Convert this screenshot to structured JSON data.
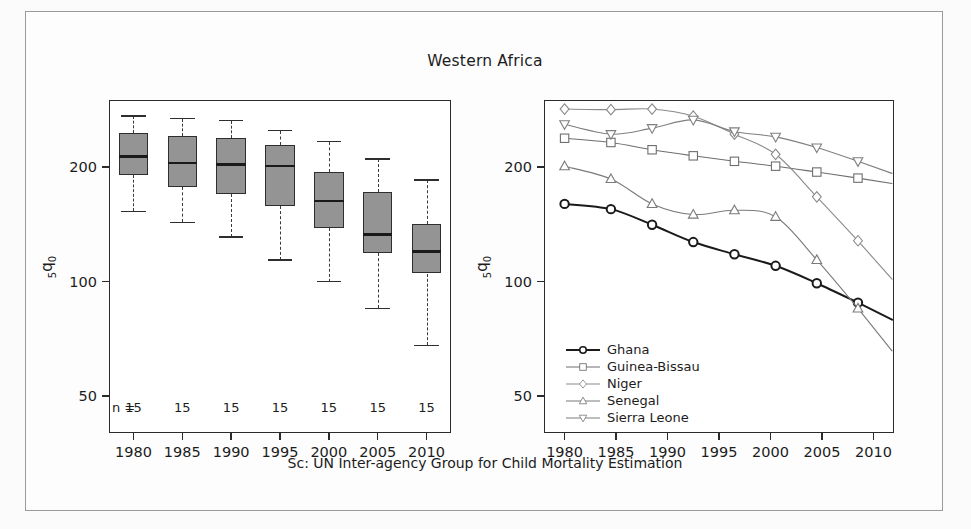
{
  "figure": {
    "title": "Western Africa",
    "caption": "Sc: UN Inter-agency Group for Child Mortality Estimation",
    "ylabel": "5q0",
    "ylabel_parts": {
      "sub_left": "5",
      "main": "q",
      "sub_right": "0"
    },
    "n_prefix": "n ="
  },
  "colors": {
    "box_fill": "#949494",
    "box_edge": "#2e2e2e",
    "median": "#1a1a1a",
    "frame": "#2b2b2b",
    "text": "#1c1c1c",
    "ghana": "#1a1a1a",
    "guinea_bissau": "#6e6e6e",
    "niger": "#8a8a8a",
    "senegal": "#7a7a7a",
    "sierra_leone": "#7f7f7f",
    "paper": "#fdfdfd"
  },
  "chart_data": [
    {
      "type": "box",
      "panel": "left",
      "title": "Western Africa",
      "xlabel": "",
      "ylabel": "5q0",
      "yscale": "log",
      "ylim": [
        40,
        300
      ],
      "yticks": [
        50,
        100,
        200
      ],
      "ytick_labels": [
        "50",
        "100",
        "200"
      ],
      "categories": [
        1980,
        1985,
        1990,
        1995,
        2000,
        2005,
        2010
      ],
      "xtick_labels": [
        "1980",
        "1985",
        "1990",
        "1995",
        "2000",
        "2005",
        "2010"
      ],
      "counts": [
        15,
        15,
        15,
        15,
        15,
        15,
        15
      ],
      "count_labels": [
        "15",
        "15",
        "15",
        "15",
        "15",
        "15",
        "15"
      ],
      "boxes": [
        {
          "category": "1980",
          "whisker_low": 153,
          "q1": 190,
          "median": 213,
          "q3": 246,
          "whisker_high": 272
        },
        {
          "category": "1985",
          "whisker_low": 143,
          "q1": 177,
          "median": 205,
          "q3": 242,
          "whisker_high": 268
        },
        {
          "category": "1990",
          "whisker_low": 131,
          "q1": 170,
          "median": 203,
          "q3": 239,
          "whisker_high": 265
        },
        {
          "category": "1995",
          "whisker_low": 114,
          "q1": 158,
          "median": 201,
          "q3": 228,
          "whisker_high": 249
        },
        {
          "category": "2000",
          "whisker_low": 100,
          "q1": 138,
          "median": 163,
          "q3": 194,
          "whisker_high": 233
        },
        {
          "category": "2005",
          "whisker_low": 85,
          "q1": 119,
          "median": 133,
          "q3": 172,
          "whisker_high": 210
        },
        {
          "category": "2010",
          "whisker_low": 68,
          "q1": 105,
          "median": 120,
          "q3": 142,
          "whisker_high": 185
        }
      ]
    },
    {
      "type": "line",
      "panel": "right",
      "xlabel": "",
      "ylabel": "5q0",
      "yscale": "log",
      "ylim": [
        40,
        300
      ],
      "yticks": [
        50,
        100,
        200
      ],
      "ytick_labels": [
        "50",
        "100",
        "200"
      ],
      "xlim": [
        1978,
        2012
      ],
      "xticks": [
        1980,
        1985,
        1990,
        1995,
        2000,
        2005,
        2010
      ],
      "xtick_labels": [
        "1980",
        "1985",
        "1990",
        "1995",
        "2000",
        "2005",
        "2010"
      ],
      "legend_position": "bottom-left",
      "series": [
        {
          "name": "Ghana",
          "marker": "circle",
          "x": [
            1980,
            1984.5,
            1988.5,
            1992.5,
            1996.5,
            2000.5,
            2004.5,
            2008.5
          ],
          "values": [
            160,
            155,
            141,
            127,
            118,
            110,
            99,
            88
          ]
        },
        {
          "name": "Guinea-Bissau",
          "marker": "square",
          "x": [
            1980,
            1984.5,
            1988.5,
            1992.5,
            1996.5,
            2000.5,
            2004.5,
            2008.5
          ],
          "values": [
            238,
            232,
            222,
            214,
            207,
            201,
            194,
            187
          ]
        },
        {
          "name": "Niger",
          "marker": "diamond",
          "x": [
            1980,
            1984.5,
            1988.5,
            1992.5,
            1996.5,
            2000.5,
            2004.5,
            2008.5
          ],
          "values": [
            284,
            283,
            284,
            272,
            244,
            216,
            167,
            128
          ]
        },
        {
          "name": "Senegal",
          "marker": "triangle-up",
          "x": [
            1980,
            1984.5,
            1988.5,
            1992.5,
            1996.5,
            2000.5,
            2004.5,
            2008.5
          ],
          "values": [
            201,
            186,
            160,
            150,
            154,
            148,
            114,
            85
          ]
        },
        {
          "name": "Sierra Leone",
          "marker": "triangle-down",
          "x": [
            1980,
            1984.5,
            1988.5,
            1992.5,
            1996.5,
            2000.5,
            2004.5,
            2008.5
          ],
          "values": [
            259,
            244,
            253,
            266,
            248,
            240,
            225,
            207
          ]
        }
      ]
    }
  ],
  "legend": {
    "items": [
      {
        "label": "Ghana",
        "marker": "circle-marker",
        "color": "#1a1a1a"
      },
      {
        "label": "Guinea-Bissau",
        "marker": "square-marker",
        "color": "#6e6e6e"
      },
      {
        "label": "Niger",
        "marker": "diamond-marker",
        "color": "#8a8a8a"
      },
      {
        "label": "Senegal",
        "marker": "triangle-up-marker",
        "color": "#7a7a7a"
      },
      {
        "label": "Sierra Leone",
        "marker": "triangle-down-marker",
        "color": "#7f7f7f"
      }
    ]
  }
}
